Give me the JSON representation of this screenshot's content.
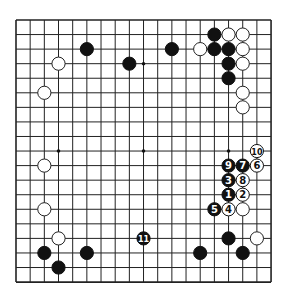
{
  "board": {
    "size": 19,
    "origin_x": 16,
    "origin_y": 20,
    "spacing_x": 14.17,
    "spacing_y": 14.56,
    "line_color": "#222222",
    "background": "#ffffff",
    "stone_radius": 6.6,
    "star_points": [
      [
        3,
        3
      ],
      [
        9,
        3
      ],
      [
        15,
        3
      ],
      [
        3,
        9
      ],
      [
        9,
        9
      ],
      [
        15,
        9
      ],
      [
        3,
        15
      ],
      [
        9,
        15
      ],
      [
        15,
        15
      ]
    ]
  },
  "stones": {
    "black": [
      [
        5,
        2
      ],
      [
        8,
        3
      ],
      [
        11,
        2
      ],
      [
        14,
        1
      ],
      [
        14,
        2
      ],
      [
        15,
        2
      ],
      [
        15,
        3
      ],
      [
        15,
        4
      ],
      [
        2,
        16
      ],
      [
        3,
        17
      ],
      [
        5,
        16
      ],
      [
        13,
        16
      ],
      [
        15,
        15
      ],
      [
        16,
        16
      ]
    ],
    "white": [
      [
        3,
        3
      ],
      [
        2,
        5
      ],
      [
        13,
        2
      ],
      [
        15,
        1
      ],
      [
        16,
        1
      ],
      [
        16,
        2
      ],
      [
        16,
        3
      ],
      [
        16,
        5
      ],
      [
        16,
        6
      ],
      [
        2,
        10
      ],
      [
        2,
        13
      ],
      [
        3,
        15
      ],
      [
        17,
        15
      ],
      [
        16,
        13
      ]
    ]
  },
  "moves": [
    {
      "n": "1",
      "color": "black",
      "pos": [
        15,
        12
      ]
    },
    {
      "n": "2",
      "color": "white",
      "pos": [
        16,
        12
      ]
    },
    {
      "n": "3",
      "color": "black",
      "pos": [
        15,
        11
      ]
    },
    {
      "n": "4",
      "color": "white",
      "pos": [
        15,
        13
      ]
    },
    {
      "n": "5",
      "color": "black",
      "pos": [
        14,
        13
      ]
    },
    {
      "n": "6",
      "color": "white",
      "pos": [
        17,
        10
      ]
    },
    {
      "n": "7",
      "color": "black",
      "pos": [
        16,
        10
      ]
    },
    {
      "n": "8",
      "color": "white",
      "pos": [
        16,
        11
      ]
    },
    {
      "n": "9",
      "color": "black",
      "pos": [
        15,
        10
      ]
    },
    {
      "n": "10",
      "color": "white",
      "pos": [
        17,
        9
      ]
    },
    {
      "n": "11",
      "color": "black",
      "pos": [
        9,
        15
      ]
    }
  ]
}
